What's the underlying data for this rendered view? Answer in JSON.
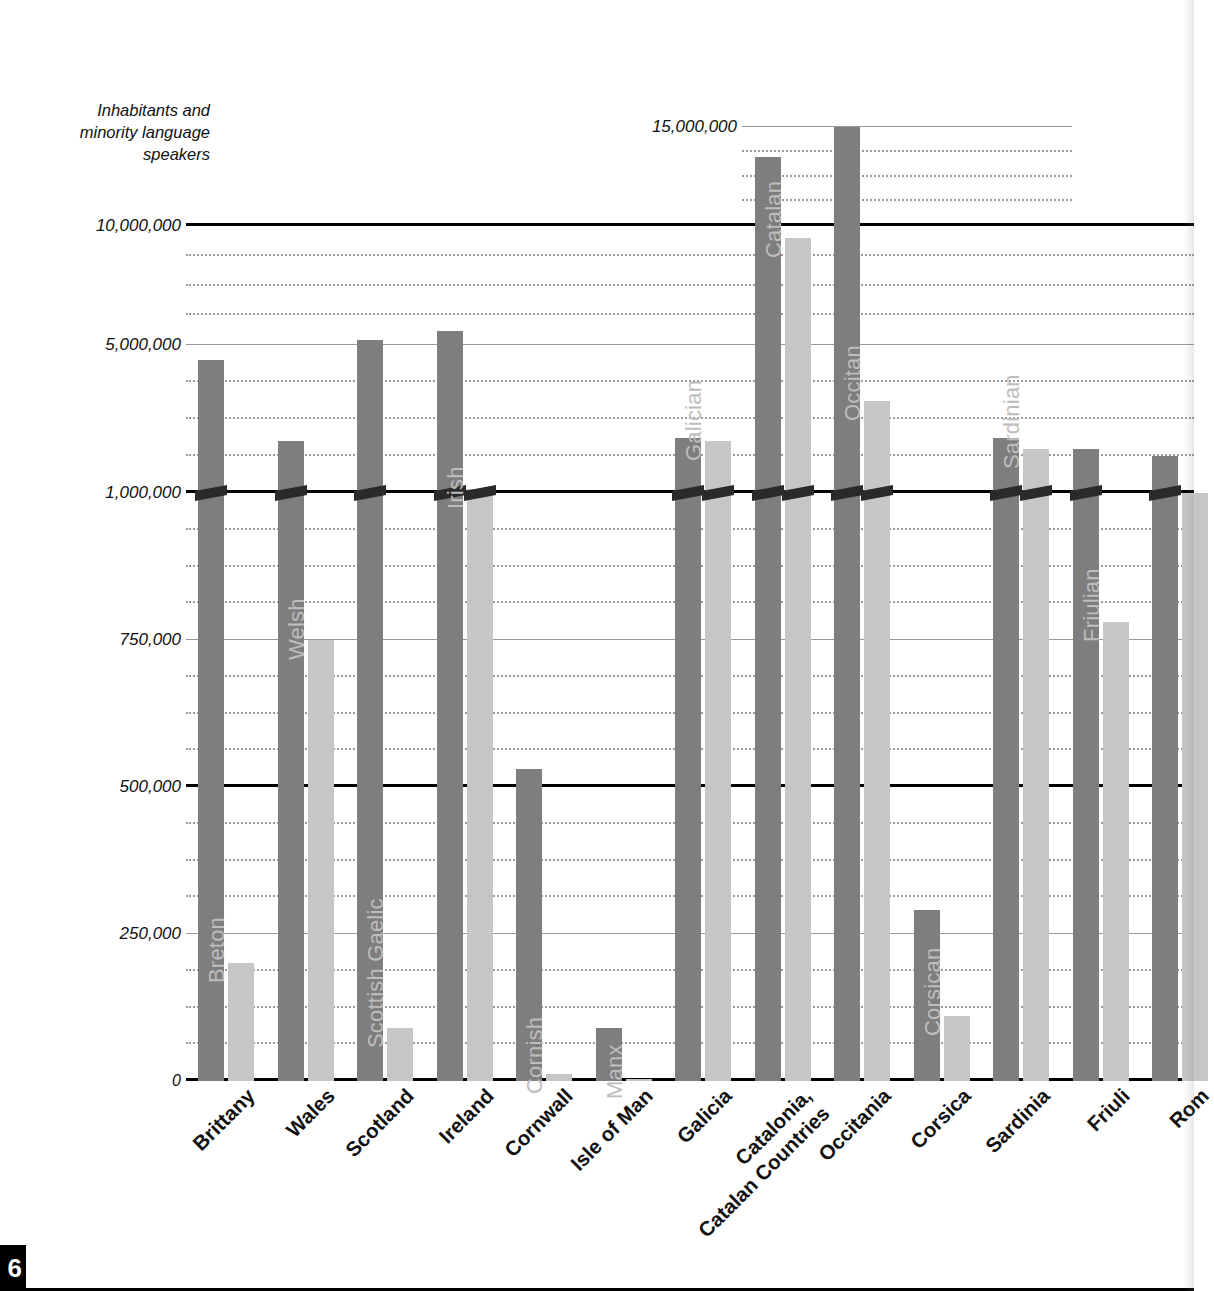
{
  "page": {
    "page_number": "6"
  },
  "axis_title": "Inhabitants and\nminority language\nspeakers",
  "chart_data": {
    "type": "bar",
    "title": "Inhabitants and minority language speakers",
    "xlabel": "",
    "ylabel": "Inhabitants and minority language speakers",
    "grid": true,
    "legend_position": "none",
    "note": "Broken (piecewise) vertical axis: linear 0-1,000,000 then compressed 1,000,000-15,000,000. Bars crossing 1,000,000 carry an axis-break slash mark.",
    "y_ticks": [
      "0",
      "250,000",
      "500,000",
      "750,000",
      "1,000,000",
      "5,000,000",
      "10,000,000",
      "15,000,000"
    ],
    "y_tick_values": [
      0,
      250000,
      500000,
      750000,
      1000000,
      5000000,
      10000000,
      15000000
    ],
    "ylim": [
      0,
      15000000
    ],
    "categories": [
      "Brittany",
      "Wales",
      "Scotland",
      "Ireland",
      "Cornwall",
      "Isle of Man",
      "Galicia",
      "Catalonia,\nCatalan Countries",
      "Occitania",
      "Corsica",
      "Sardinia",
      "Friuli",
      "Rom"
    ],
    "series": [
      {
        "name": "Inhabitants",
        "color": "#7e7e7e",
        "values": [
          4600000,
          2400000,
          5200000,
          5600000,
          530000,
          90000,
          2500000,
          13500000,
          15000000,
          290000,
          2500000,
          2200000,
          2000000
        ]
      },
      {
        "name": "Minority language speakers",
        "color": "#c6c6c6",
        "labels": [
          "Breton",
          "Welsh",
          "Scottish Gaelic",
          "Irish",
          "Cornish",
          "Manx",
          "Galician",
          "Catalan",
          "Occitan",
          "Corsican",
          "Sardinian",
          "Friulian",
          ""
        ],
        "values": [
          200000,
          750000,
          90000,
          1100000,
          12000,
          3000,
          2400000,
          9500000,
          3500000,
          110000,
          2200000,
          780000,
          1000000
        ]
      }
    ]
  }
}
